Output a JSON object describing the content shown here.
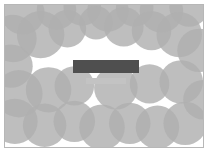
{
  "figure": {
    "canvas": {
      "width": 208,
      "height": 152
    },
    "frame": {
      "x": 4,
      "y": 4,
      "width": 200,
      "height": 144,
      "border_color": "#b7b7b7"
    },
    "background_color": "#ffffff",
    "circle_fill_color": "#b0b0b0",
    "circle_fill_opacity": 0.82,
    "circle_blend_mode": "multiply",
    "overlap_color": "#6e6e6e"
  },
  "bars": {
    "primary": {
      "name": "thick dark bar",
      "label": "",
      "color": "#4f4f4f",
      "x": 68,
      "y": 55,
      "width": 66,
      "height": 13
    },
    "secondary": {
      "name": "thin light bar",
      "label": "",
      "color": "#c3c3c3",
      "x": 81,
      "y": 73,
      "width": 40,
      "height": 6
    }
  },
  "chart_data": {
    "type": "scatter",
    "title": "",
    "subtitle": "",
    "xlabel": "",
    "ylabel": "",
    "xlim": [
      0,
      200
    ],
    "ylim": [
      0,
      144
    ],
    "grid": false,
    "legend": null,
    "annotations": [],
    "marker": {
      "shape": "circle",
      "fill": "#b0b0b0",
      "opacity": 0.82,
      "blend": "multiply",
      "edge": "none"
    },
    "points": [
      {
        "x": 18,
        "y": 8,
        "r": 22
      },
      {
        "x": 52,
        "y": 5,
        "r": 20
      },
      {
        "x": 78,
        "y": 2,
        "r": 19
      },
      {
        "x": 104,
        "y": 6,
        "r": 21
      },
      {
        "x": 131,
        "y": 3,
        "r": 19
      },
      {
        "x": 158,
        "y": 6,
        "r": 22
      },
      {
        "x": 186,
        "y": 2,
        "r": 20
      },
      {
        "x": 8,
        "y": 34,
        "r": 24
      },
      {
        "x": 36,
        "y": 30,
        "r": 24
      },
      {
        "x": 63,
        "y": 24,
        "r": 19
      },
      {
        "x": 92,
        "y": 18,
        "r": 17
      },
      {
        "x": 120,
        "y": 22,
        "r": 20
      },
      {
        "x": 148,
        "y": 26,
        "r": 20
      },
      {
        "x": 176,
        "y": 30,
        "r": 23
      },
      {
        "x": 196,
        "y": 46,
        "r": 22
      },
      {
        "x": 6,
        "y": 62,
        "r": 22
      },
      {
        "x": 14,
        "y": 90,
        "r": 24
      },
      {
        "x": 44,
        "y": 86,
        "r": 23
      },
      {
        "x": 70,
        "y": 82,
        "r": 20
      },
      {
        "x": 112,
        "y": 84,
        "r": 22
      },
      {
        "x": 146,
        "y": 80,
        "r": 20
      },
      {
        "x": 178,
        "y": 78,
        "r": 22
      },
      {
        "x": 10,
        "y": 118,
        "r": 23
      },
      {
        "x": 40,
        "y": 122,
        "r": 22
      },
      {
        "x": 70,
        "y": 118,
        "r": 21
      },
      {
        "x": 98,
        "y": 124,
        "r": 23
      },
      {
        "x": 126,
        "y": 120,
        "r": 21
      },
      {
        "x": 154,
        "y": 124,
        "r": 22
      },
      {
        "x": 182,
        "y": 120,
        "r": 22
      },
      {
        "x": 200,
        "y": 96,
        "r": 20
      }
    ]
  }
}
